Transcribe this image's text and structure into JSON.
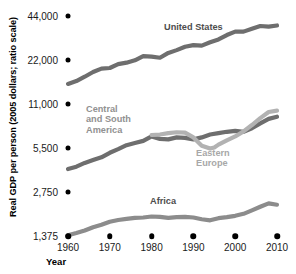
{
  "chart_data": {
    "type": "line",
    "title": "",
    "xlabel": "Year",
    "ylabel": "Real GDP per person (2005 dollars; ratio scale)",
    "xticks": [
      1960,
      1970,
      1980,
      1990,
      2000,
      2010
    ],
    "xtick_labels": [
      "1960",
      "1970",
      "1980",
      "1990",
      "2000",
      "2010"
    ],
    "yticks": [
      1375,
      2750,
      5500,
      11000,
      22000,
      44000
    ],
    "ytick_labels": [
      "1,375",
      "2,750",
      "5,500",
      "11,000",
      "22,000",
      "44,000"
    ],
    "ylim": [
      1375,
      44000
    ],
    "xlim": [
      1960,
      2010
    ],
    "yscale": "log2 (ratio scale)",
    "grid": false,
    "legend": "inline annotations",
    "series": [
      {
        "name": "United States",
        "color": "#6e6e6e",
        "label_color": "#4d4d4d",
        "x": [
          1960,
          1962,
          1964,
          1966,
          1968,
          1970,
          1972,
          1974,
          1976,
          1978,
          1980,
          1982,
          1984,
          1986,
          1988,
          1990,
          1992,
          1994,
          1996,
          1998,
          2000,
          2002,
          2004,
          2006,
          2008,
          2010
        ],
        "values": [
          15100,
          15800,
          16900,
          18200,
          19200,
          19400,
          20600,
          21100,
          21900,
          23400,
          23200,
          22800,
          24600,
          25700,
          27100,
          27800,
          27600,
          29100,
          30400,
          32600,
          34400,
          34400,
          36000,
          37600,
          37200,
          37900
        ]
      },
      {
        "name": "Central and South America",
        "color": "#6e6e6e",
        "label_color": "#8a8a8a",
        "x": [
          1960,
          1962,
          1964,
          1966,
          1968,
          1970,
          1972,
          1974,
          1976,
          1978,
          1980,
          1982,
          1984,
          1986,
          1988,
          1990,
          1992,
          1994,
          1996,
          1998,
          2000,
          2002,
          2004,
          2006,
          2008,
          2010
        ],
        "values": [
          3950,
          4100,
          4350,
          4550,
          4750,
          5100,
          5400,
          5750,
          5950,
          6150,
          6600,
          6350,
          6300,
          6500,
          6450,
          6300,
          6500,
          6800,
          6950,
          7100,
          7200,
          7100,
          7500,
          8100,
          8700,
          9000
        ]
      },
      {
        "name": "Eastern Europe",
        "color": "#b2b2b2",
        "label_color": "#a8a8a8",
        "x": [
          1980,
          1982,
          1984,
          1986,
          1988,
          1990,
          1992,
          1994,
          1995,
          1996,
          1998,
          2000,
          2002,
          2004,
          2006,
          2008,
          2010
        ],
        "values": [
          6750,
          6800,
          6950,
          7050,
          7000,
          6500,
          5700,
          5450,
          5550,
          5800,
          6200,
          6600,
          7150,
          7900,
          8800,
          9700,
          9900
        ]
      },
      {
        "name": "Africa",
        "color": "#8c8c8c",
        "label_color": "#4d4d4d",
        "x": [
          1960,
          1962,
          1964,
          1966,
          1968,
          1970,
          1972,
          1974,
          1976,
          1978,
          1980,
          1982,
          1984,
          1986,
          1988,
          1990,
          1992,
          1994,
          1996,
          1998,
          2000,
          2002,
          2004,
          2006,
          2008,
          2010
        ],
        "values": [
          1390,
          1440,
          1500,
          1580,
          1640,
          1720,
          1770,
          1800,
          1830,
          1840,
          1870,
          1860,
          1830,
          1850,
          1860,
          1840,
          1790,
          1760,
          1820,
          1850,
          1890,
          1950,
          2060,
          2180,
          2300,
          2250
        ]
      }
    ]
  },
  "axis": {
    "y_title": "Real GDP per person (2005 dollars; ratio scale)",
    "x_title": "Year"
  },
  "annotations": {
    "united_states": "United States",
    "central_south_america": "Central\nand South\nAmerica",
    "eastern_europe": "Eastern\nEurope",
    "africa": "Africa"
  }
}
